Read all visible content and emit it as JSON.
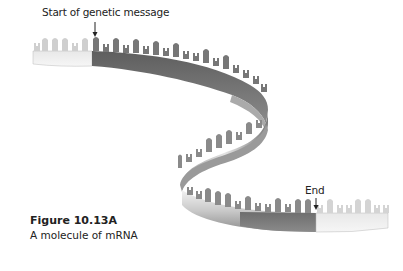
{
  "labels": {
    "start": "Start of genetic message",
    "end": "End"
  },
  "caption": {
    "title": "Figure 10.13A",
    "text": "A molecule of mRNA"
  },
  "colors": {
    "coding_region": "#6e6e6e",
    "untranslated_region": "#d4d4d4",
    "ribbon_highlight": "#e6e6e6",
    "ribbon_shadow": "#8a8a8a",
    "text": "#222222"
  },
  "segments": [
    {
      "name": "leader",
      "shade": "light"
    },
    {
      "name": "coding-sequence",
      "shade": "dark"
    },
    {
      "name": "trailer",
      "shade": "light"
    }
  ]
}
